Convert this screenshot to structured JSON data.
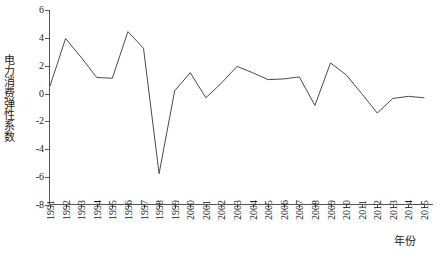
{
  "chart_data": {
    "type": "line",
    "title": "",
    "xlabel": "年份",
    "ylabel": "电力消费弹性系数",
    "categories": [
      "1991",
      "1992",
      "1993",
      "1994",
      "1995",
      "1996",
      "1997",
      "1998",
      "1999",
      "2000",
      "2001",
      "2002",
      "2003",
      "2004",
      "2005",
      "2006",
      "2007",
      "2008",
      "2009",
      "2010",
      "2011",
      "2012",
      "2013",
      "2014",
      "2015"
    ],
    "values": [
      0.55,
      3.95,
      2.6,
      1.15,
      1.1,
      4.45,
      3.25,
      -5.75,
      0.2,
      1.5,
      -0.3,
      0.75,
      1.95,
      1.5,
      1.0,
      1.05,
      1.2,
      -0.85,
      2.2,
      1.35,
      0.0,
      -1.4,
      -0.35,
      -0.2,
      -0.3
    ],
    "ylim": [
      -8,
      6
    ],
    "yticks": [
      6,
      4,
      2,
      0,
      -2,
      -4,
      -6,
      -8
    ],
    "ytick_labels": [
      "6",
      "4",
      "2",
      "0",
      "-2",
      "-4",
      "-6",
      "-8"
    ],
    "xlim": [
      "1991",
      "2015"
    ],
    "grid": false,
    "legend": null,
    "series_color": "#4a4a4a",
    "axis_color": "#555555",
    "text_color": "#1a1a1a"
  }
}
